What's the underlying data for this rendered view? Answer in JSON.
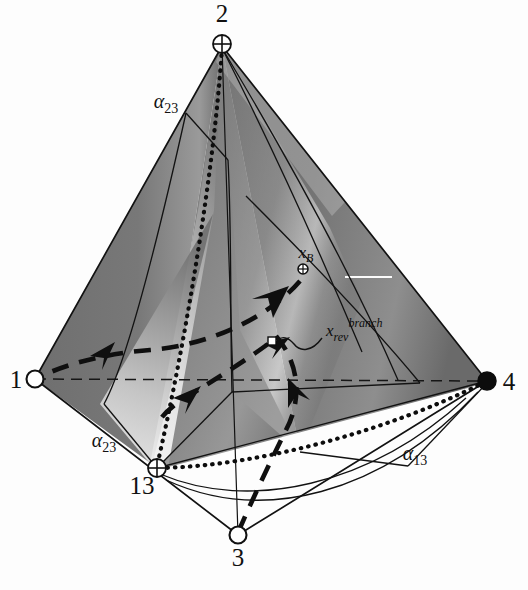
{
  "figure": {
    "kind": "diagram",
    "background_color": "#fdfdfd",
    "surface_dark": "#6a6a6a",
    "surface_mid": "#8c8c8c",
    "surface_light": "#d8d8d8",
    "surface_highlight": "#f2f2f2",
    "line_color": "#121212"
  },
  "vertices": [
    {
      "id": "v2",
      "label": "2",
      "marker": "circle-cross",
      "x": 222,
      "y": 44,
      "label_x": 222,
      "label_y": 22,
      "label_anchor": "middle"
    },
    {
      "id": "v1",
      "label": "1",
      "marker": "circle-open",
      "x": 35,
      "y": 379,
      "label_x": 16,
      "label_y": 388,
      "label_anchor": "middle"
    },
    {
      "id": "v4",
      "label": "4",
      "marker": "circle-filled",
      "x": 487,
      "y": 381,
      "label_x": 509,
      "label_y": 390,
      "label_anchor": "middle"
    },
    {
      "id": "v3",
      "label": "3",
      "marker": "circle-open",
      "x": 238,
      "y": 535,
      "label_x": 238,
      "label_y": 566,
      "label_anchor": "middle"
    },
    {
      "id": "v13",
      "label": "13",
      "marker": "circle-cross",
      "x": 157,
      "y": 468,
      "label_x": 142,
      "label_y": 494,
      "label_anchor": "middle"
    }
  ],
  "annotations": [
    {
      "id": "a23-top",
      "base": "α",
      "sub": "23",
      "x": 166,
      "y": 108,
      "anchor": "middle"
    },
    {
      "id": "a23-bottom",
      "base": "α",
      "sub": "23",
      "x": 104,
      "y": 447,
      "anchor": "middle"
    },
    {
      "id": "a13-right",
      "base": "α",
      "sub": "13",
      "x": 415,
      "y": 460,
      "anchor": "middle"
    }
  ],
  "points": [
    {
      "id": "xB",
      "base": "x",
      "sub": "B",
      "sup": "",
      "marker": "circle-cross-small",
      "marker_x": 303,
      "marker_y": 269,
      "label_x": 306,
      "label_y": 258,
      "label_anchor": "middle"
    },
    {
      "id": "xrev-branch",
      "base": "x",
      "sub": "rev",
      "sup": "branch",
      "marker": "square-open-small",
      "marker_x": 272,
      "marker_y": 341,
      "label_x": 326,
      "label_y": 330,
      "label_anchor": "start"
    }
  ],
  "curves": {
    "trajectory_style": "dashed-thick",
    "boundary_style": "dotted-thick",
    "edge_hidden_style": "dashed-thin",
    "arrow_count": 4
  }
}
